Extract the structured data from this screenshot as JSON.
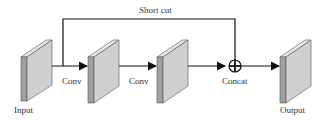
{
  "diagram": {
    "shortcut_label": "Short cut",
    "labels": {
      "input": "Input",
      "conv1": "Conv",
      "conv2": "Conv",
      "concat": "Concat",
      "output": "Output"
    },
    "colors": {
      "line": "#111111",
      "block_face": "#c8c8c8",
      "block_side": "#9a9a9a",
      "block_top": "#e0e0e0"
    }
  }
}
